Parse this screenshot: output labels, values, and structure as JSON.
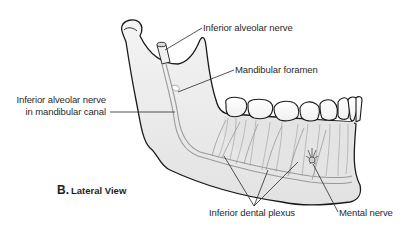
{
  "figure": {
    "caption_letter": "B.",
    "caption_text": "Lateral View"
  },
  "labels": {
    "inferior_alveolar_nerve": "Inferior alveolar nerve",
    "mandibular_foramen": "Mandibular foramen",
    "nerve_in_canal_line1": "Inferior alveolar nerve",
    "nerve_in_canal_line2": "in mandibular canal",
    "inferior_dental_plexus": "Inferior dental plexus",
    "mental_nerve": "Mental nerve"
  },
  "colors": {
    "bone_fill": "#ededed",
    "outline": "#1a1a1a",
    "nerve": "#9a9a9a",
    "text": "#2a2a2a",
    "leader": "#2a2a2a"
  }
}
